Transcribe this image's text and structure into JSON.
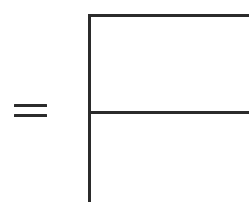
{
  "figure": {
    "kind": "equation-fragment",
    "background_color": "#ffffff",
    "stroke_color": "#2b2b2b",
    "width_px": 249,
    "height_px": 202,
    "operator": {
      "name": "equals",
      "glyph": "=",
      "bar_count": 2,
      "left_px": 14,
      "top_px": 104,
      "width_px": 33,
      "height_px": 16,
      "bar_thickness_px": 3,
      "bar_gap_px": 7
    },
    "rules": [
      {
        "name": "vertical-rule",
        "orientation": "vertical",
        "x_px": 88,
        "y_start_px": 14,
        "y_end_px": 202,
        "thickness_px": 3,
        "clipped_at": "bottom"
      },
      {
        "name": "top-horizontal-rule",
        "orientation": "horizontal",
        "y_px": 14,
        "x_start_px": 88,
        "x_end_px": 249,
        "thickness_px": 3,
        "clipped_at": "right"
      },
      {
        "name": "middle-horizontal-rule",
        "orientation": "horizontal",
        "y_px": 111,
        "x_start_px": 88,
        "x_end_px": 249,
        "thickness_px": 3,
        "clipped_at": "right"
      }
    ],
    "junctions": [
      {
        "name": "top-left-corner",
        "type": "corner",
        "x_px": 89,
        "y_px": 15
      },
      {
        "name": "mid-left-tee",
        "type": "tee",
        "x_px": 89,
        "y_px": 112
      }
    ]
  }
}
